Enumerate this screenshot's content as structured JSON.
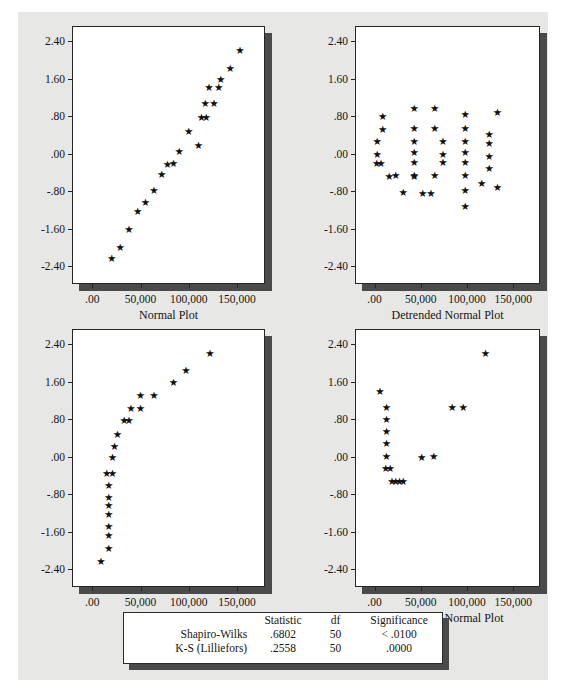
{
  "page": {
    "background_color": "#e7e7e5",
    "marker_glyph": "★",
    "marker_color": "#111111",
    "frame_color": "#262626",
    "shadow_color": "#4a4a4a"
  },
  "chart_data": [
    {
      "id": "top-left",
      "type": "scatter",
      "title": "",
      "xlabel": "Normal Plot",
      "ylabel": "",
      "xlim": [
        -20000,
        180000
      ],
      "ylim": [
        -2.8,
        2.7
      ],
      "xticks": [
        0,
        50000,
        100000,
        150000
      ],
      "xticklabels": [
        ".00",
        "50,000",
        "100,000",
        "150,000"
      ],
      "yticks": [
        2.4,
        1.6,
        0.8,
        0.0,
        -0.8,
        -1.6,
        -2.4
      ],
      "yticklabels": [
        "2.40",
        "1.60",
        ".80",
        ".00",
        "-.80",
        "-1.60",
        "-2.40"
      ],
      "grid": false,
      "legend": "none",
      "points": [
        [
          20000,
          -2.22
        ],
        [
          29000,
          -1.98
        ],
        [
          38000,
          -1.6
        ],
        [
          47000,
          -1.22
        ],
        [
          55000,
          -1.03
        ],
        [
          64000,
          -0.78
        ],
        [
          72000,
          -0.43
        ],
        [
          78000,
          -0.21
        ],
        [
          84000,
          -0.19
        ],
        [
          90000,
          0.06
        ],
        [
          100000,
          0.48
        ],
        [
          110000,
          0.19
        ],
        [
          113000,
          0.78
        ],
        [
          118000,
          0.78
        ],
        [
          117000,
          1.08
        ],
        [
          126000,
          1.08
        ],
        [
          121000,
          1.42
        ],
        [
          131000,
          1.42
        ],
        [
          133000,
          1.6
        ],
        [
          143000,
          1.82
        ],
        [
          153000,
          2.2
        ]
      ]
    },
    {
      "id": "top-right",
      "type": "scatter",
      "title": "",
      "xlabel": "Detrended Normal Plot",
      "ylabel": "",
      "xlim": [
        -20000,
        180000
      ],
      "ylim": [
        -2.8,
        2.7
      ],
      "xticks": [
        0,
        50000,
        100000,
        150000
      ],
      "xticklabels": [
        ".00",
        "50,000",
        "100,000",
        "150,000"
      ],
      "yticks": [
        2.4,
        1.6,
        0.8,
        0.0,
        -0.8,
        -1.6,
        -2.4
      ],
      "yticklabels": [
        "2.40",
        "1.60",
        ".80",
        ".00",
        "-.80",
        "-1.60",
        "-2.40"
      ],
      "grid": false,
      "legend": "none",
      "points": [
        [
          9000,
          0.8
        ],
        [
          9000,
          0.53
        ],
        [
          3000,
          0.27
        ],
        [
          3000,
          0.0
        ],
        [
          2500,
          -0.2
        ],
        [
          7000,
          -0.2
        ],
        [
          16000,
          -0.48
        ],
        [
          23000,
          -0.45
        ],
        [
          31000,
          -0.82
        ],
        [
          43000,
          0.97
        ],
        [
          43000,
          0.55
        ],
        [
          43000,
          0.28
        ],
        [
          43000,
          0.03
        ],
        [
          43000,
          -0.18
        ],
        [
          43000,
          -0.45
        ],
        [
          43000,
          -0.48
        ],
        [
          52000,
          -0.83
        ],
        [
          61000,
          -0.83
        ],
        [
          65000,
          0.97
        ],
        [
          65000,
          0.55
        ],
        [
          65000,
          -0.45
        ],
        [
          74000,
          0.27
        ],
        [
          74000,
          0.0
        ],
        [
          74000,
          -0.18
        ],
        [
          98000,
          0.85
        ],
        [
          98000,
          0.55
        ],
        [
          98000,
          0.27
        ],
        [
          98000,
          0.03
        ],
        [
          98000,
          -0.18
        ],
        [
          98000,
          -0.45
        ],
        [
          98000,
          -0.78
        ],
        [
          98000,
          -1.12
        ],
        [
          116000,
          -0.62
        ],
        [
          124000,
          0.42
        ],
        [
          124000,
          0.22
        ],
        [
          124000,
          -0.05
        ],
        [
          124000,
          -0.3
        ],
        [
          133000,
          0.89
        ],
        [
          133000,
          -0.72
        ]
      ]
    },
    {
      "id": "bottom-left",
      "type": "scatter",
      "title": "",
      "xlabel": "Normal Plot",
      "ylabel": "",
      "xlim": [
        -20000,
        180000
      ],
      "ylim": [
        -2.8,
        2.7
      ],
      "xticks": [
        0,
        50000,
        100000,
        150000
      ],
      "xticklabels": [
        ".00",
        "50,000",
        "100,000",
        "150,000"
      ],
      "yticks": [
        2.4,
        1.6,
        0.8,
        0.0,
        -0.8,
        -1.6,
        -2.4
      ],
      "yticklabels": [
        "2.40",
        "1.60",
        ".80",
        ".00",
        "-.80",
        "-1.60",
        "-2.40"
      ],
      "grid": false,
      "legend": "none",
      "points": [
        [
          9000,
          -2.22
        ],
        [
          17000,
          -1.95
        ],
        [
          17000,
          -1.67
        ],
        [
          17000,
          -1.48
        ],
        [
          17000,
          -1.22
        ],
        [
          17000,
          -1.03
        ],
        [
          17000,
          -0.85
        ],
        [
          17000,
          -0.6
        ],
        [
          15000,
          -0.35
        ],
        [
          21000,
          -0.35
        ],
        [
          21000,
          0.0
        ],
        [
          23000,
          0.22
        ],
        [
          26000,
          0.48
        ],
        [
          33000,
          0.78
        ],
        [
          38000,
          0.78
        ],
        [
          40000,
          1.04
        ],
        [
          50000,
          1.04
        ],
        [
          50000,
          1.32
        ],
        [
          64000,
          1.32
        ],
        [
          84000,
          1.6
        ],
        [
          97000,
          1.85
        ],
        [
          122000,
          2.2
        ]
      ]
    },
    {
      "id": "bottom-right",
      "type": "scatter",
      "title": "",
      "xlabel": "Detrended Normal Plot",
      "ylabel": "",
      "xlim": [
        -20000,
        180000
      ],
      "ylim": [
        -2.8,
        2.7
      ],
      "xticks": [
        0,
        50000,
        100000,
        150000
      ],
      "xticklabels": [
        ".00",
        "50,000",
        "100,000",
        "150,000"
      ],
      "yticks": [
        2.4,
        1.6,
        0.8,
        0.0,
        -0.8,
        -1.6,
        -2.4
      ],
      "yticklabels": [
        "2.40",
        "1.60",
        ".80",
        ".00",
        "-.80",
        "-1.60",
        "-2.40"
      ],
      "grid": false,
      "legend": "none",
      "points": [
        [
          6000,
          1.4
        ],
        [
          13000,
          1.05
        ],
        [
          13000,
          0.8
        ],
        [
          13000,
          0.55
        ],
        [
          13000,
          0.3
        ],
        [
          13000,
          0.02
        ],
        [
          12000,
          -0.25
        ],
        [
          17000,
          -0.25
        ],
        [
          19000,
          -0.52
        ],
        [
          23000,
          -0.52
        ],
        [
          27000,
          -0.52
        ],
        [
          31000,
          -0.52
        ],
        [
          51000,
          0.0
        ],
        [
          64000,
          0.02
        ],
        [
          84000,
          1.05
        ],
        [
          96000,
          1.06
        ],
        [
          120000,
          2.2
        ]
      ]
    }
  ],
  "stats_table": {
    "columns": [
      "",
      "Statistic",
      "df",
      "Significance"
    ],
    "rows": [
      {
        "name": "Shapiro-Wilks",
        "statistic": ".6802",
        "df": "50",
        "significance": "< .0100"
      },
      {
        "name": "K-S (Lilliefors)",
        "statistic": ".2558",
        "df": "50",
        "significance": ".0000"
      }
    ]
  }
}
